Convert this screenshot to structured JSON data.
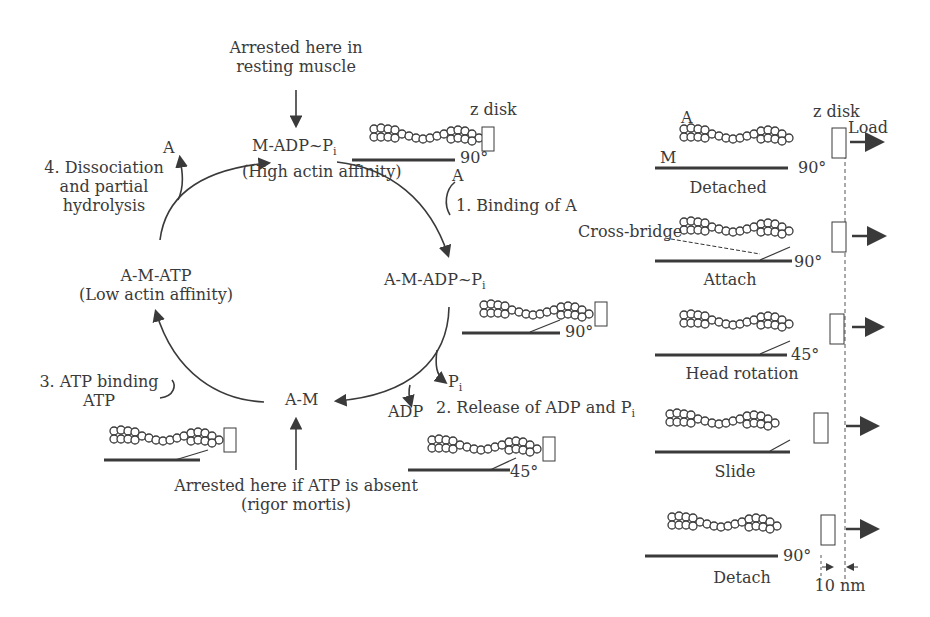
{
  "cycle": {
    "top_note": [
      "Arrested here in",
      "resting muscle"
    ],
    "bottom_note": [
      "Arrested here if ATP is absent",
      "(rigor mortis)"
    ],
    "states": {
      "m_adp_pi": {
        "main": "M-ADP~P",
        "sub": "i",
        "note": "(High actin affinity)"
      },
      "a_m_adp_pi": {
        "main": "A-M-ADP~P",
        "sub": "i"
      },
      "a_m": {
        "main": "A-M"
      },
      "a_m_atp": {
        "main": "A-M-ATP",
        "note": "(Low actin affinity)"
      }
    },
    "steps": {
      "step1": {
        "label": "1. Binding of A",
        "species": "A"
      },
      "step2": {
        "label": "2. Release of ADP and P",
        "sub": "i",
        "species_adp": "ADP",
        "species_pi": "P",
        "species_pi_sub": "i"
      },
      "step3": {
        "label": "3. ATP binding",
        "species": "ATP"
      },
      "step4": {
        "label": [
          "4. Dissociation",
          "and partial",
          "hydrolysis"
        ],
        "species": "A"
      }
    },
    "filament_labels": {
      "zdisk": "z disk",
      "angle_top": "90°",
      "angle_right": "90°",
      "angle_bottom": "45°"
    }
  },
  "panel": {
    "zdisk": "z disk",
    "actin_label": "A",
    "myosin_label": "M",
    "load": "Load",
    "cross_bridge": "Cross-bridge",
    "stages": [
      {
        "name": "Detached",
        "angle": "90°"
      },
      {
        "name": "Attach",
        "angle": "90°"
      },
      {
        "name": "Head rotation",
        "angle": "45°"
      },
      {
        "name": "Slide",
        "angle": ""
      },
      {
        "name": "Detach",
        "angle": "90°"
      }
    ],
    "scale": "10 nm"
  }
}
